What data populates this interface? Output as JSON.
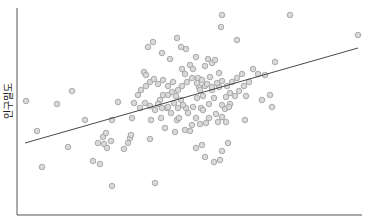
{
  "chart_data": {
    "type": "scatter",
    "title": "",
    "xlabel": "",
    "ylabel": "인구밀도",
    "grid": false,
    "legend": null,
    "axis_ticks_shown": false,
    "pixel_frame": {
      "x0": 17,
      "y0": 215,
      "x1": 362,
      "y1": 8
    },
    "marker": {
      "shape": "circle",
      "fill": "#d9d9d9",
      "stroke": "#9a9a9a",
      "radius": 2.8
    },
    "regression_line": {
      "x_start": 25,
      "y_start": 143,
      "x_end": 358,
      "y_end": 48,
      "color": "#333333"
    },
    "points_px": [
      [
        26,
        101
      ],
      [
        37,
        131
      ],
      [
        42,
        167
      ],
      [
        57,
        104
      ],
      [
        68,
        147
      ],
      [
        72,
        91
      ],
      [
        85,
        120
      ],
      [
        93,
        161
      ],
      [
        98,
        143
      ],
      [
        100,
        164
      ],
      [
        103,
        137
      ],
      [
        104,
        144
      ],
      [
        106,
        133
      ],
      [
        107,
        148
      ],
      [
        111,
        141
      ],
      [
        112,
        120
      ],
      [
        112,
        186
      ],
      [
        118,
        102
      ],
      [
        124,
        149
      ],
      [
        128,
        143
      ],
      [
        130,
        138
      ],
      [
        131,
        135
      ],
      [
        134,
        103
      ],
      [
        132,
        118
      ],
      [
        144,
        72
      ],
      [
        146,
        75
      ],
      [
        150,
        139
      ],
      [
        151,
        120
      ],
      [
        155,
        183
      ],
      [
        160,
        100
      ],
      [
        161,
        118
      ],
      [
        163,
        95
      ],
      [
        167,
        108
      ],
      [
        168,
        107
      ],
      [
        165,
        128
      ],
      [
        171,
        113
      ],
      [
        175,
        132
      ],
      [
        177,
        120
      ],
      [
        170,
        59
      ],
      [
        162,
        53
      ],
      [
        148,
        47
      ],
      [
        153,
        42
      ],
      [
        177,
        38
      ],
      [
        181,
        47
      ],
      [
        186,
        49
      ],
      [
        182,
        69
      ],
      [
        185,
        74
      ],
      [
        190,
        65
      ],
      [
        193,
        69
      ],
      [
        196,
        57
      ],
      [
        198,
        78
      ],
      [
        199,
        87
      ],
      [
        205,
        66
      ],
      [
        208,
        59
      ],
      [
        210,
        77
      ],
      [
        212,
        63
      ],
      [
        215,
        60
      ],
      [
        219,
        73
      ],
      [
        222,
        15
      ],
      [
        221,
        27
      ],
      [
        237,
        40
      ],
      [
        230,
        93
      ],
      [
        226,
        97
      ],
      [
        222,
        105
      ],
      [
        219,
        87
      ],
      [
        214,
        98
      ],
      [
        212,
        90
      ],
      [
        209,
        104
      ],
      [
        205,
        86
      ],
      [
        203,
        96
      ],
      [
        201,
        108
      ],
      [
        197,
        98
      ],
      [
        193,
        107
      ],
      [
        196,
        118
      ],
      [
        188,
        113
      ],
      [
        186,
        108
      ],
      [
        183,
        105
      ],
      [
        181,
        100
      ],
      [
        178,
        108
      ],
      [
        176,
        96
      ],
      [
        174,
        103
      ],
      [
        172,
        92
      ],
      [
        168,
        95
      ],
      [
        162,
        108
      ],
      [
        158,
        104
      ],
      [
        155,
        110
      ],
      [
        150,
        106
      ],
      [
        145,
        103
      ],
      [
        140,
        108
      ],
      [
        138,
        95
      ],
      [
        141,
        90
      ],
      [
        146,
        86
      ],
      [
        150,
        82
      ],
      [
        154,
        79
      ],
      [
        158,
        84
      ],
      [
        163,
        80
      ],
      [
        168,
        86
      ],
      [
        173,
        82
      ],
      [
        178,
        90
      ],
      [
        182,
        86
      ],
      [
        187,
        82
      ],
      [
        192,
        78
      ],
      [
        197,
        83
      ],
      [
        202,
        80
      ],
      [
        207,
        84
      ],
      [
        212,
        87
      ],
      [
        217,
        83
      ],
      [
        222,
        81
      ],
      [
        227,
        86
      ],
      [
        232,
        82
      ],
      [
        237,
        78
      ],
      [
        242,
        74
      ],
      [
        246,
        96
      ],
      [
        249,
        82
      ],
      [
        253,
        69
      ],
      [
        258,
        74
      ],
      [
        265,
        75
      ],
      [
        270,
        95
      ],
      [
        272,
        107
      ],
      [
        275,
        62
      ],
      [
        244,
        86
      ],
      [
        239,
        91
      ],
      [
        235,
        96
      ],
      [
        230,
        104
      ],
      [
        225,
        109
      ],
      [
        222,
        117
      ],
      [
        218,
        122
      ],
      [
        203,
        110
      ],
      [
        200,
        124
      ],
      [
        192,
        125
      ],
      [
        190,
        131
      ],
      [
        185,
        130
      ],
      [
        179,
        118
      ],
      [
        229,
        107
      ],
      [
        206,
        123
      ],
      [
        202,
        145
      ],
      [
        205,
        157
      ],
      [
        222,
        151
      ],
      [
        220,
        160
      ],
      [
        214,
        162
      ],
      [
        226,
        122
      ],
      [
        196,
        148
      ],
      [
        290,
        15
      ],
      [
        358,
        35
      ],
      [
        262,
        100
      ],
      [
        245,
        120
      ],
      [
        228,
        143
      ],
      [
        200,
        90
      ],
      [
        216,
        114
      ],
      [
        209,
        118
      ]
    ]
  }
}
